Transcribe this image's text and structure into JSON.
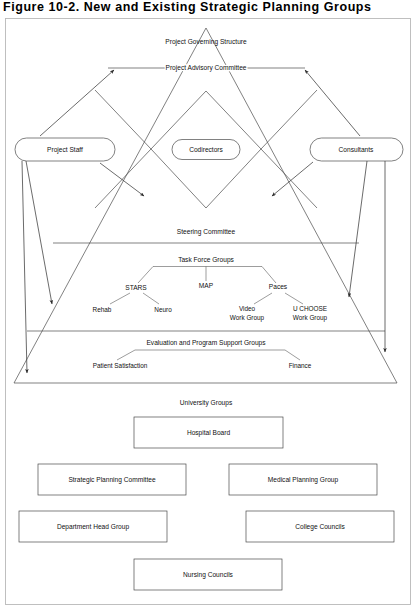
{
  "figure": {
    "title": "Figure 10-2.   New and Existing Strategic Planning Groups",
    "title_number": "Figure 10-2.",
    "title_text": "New and Existing Strategic Planning Groups"
  },
  "pyramid": {
    "levels": [
      {
        "id": "governing",
        "label": "Project Governing Structure"
      },
      {
        "id": "advisory",
        "label": "Project Advisory Committee"
      },
      {
        "id": "steering",
        "label": "Steering Committee"
      },
      {
        "id": "taskforce",
        "label": "Task Force Groups"
      },
      {
        "id": "evaluation",
        "label": "Evaluation and Program Support Groups"
      }
    ]
  },
  "pills": [
    {
      "id": "project-staff",
      "label": "Project Staff"
    },
    {
      "id": "codirectors",
      "label": "Codirectors"
    },
    {
      "id": "consultants",
      "label": "Consultants"
    }
  ],
  "task_force_tree": {
    "root": "Task Force Groups",
    "branches": [
      {
        "label": "STARS",
        "children": [
          "Rehab",
          "Neuro"
        ]
      },
      {
        "label": "MAP",
        "children": []
      },
      {
        "label": "Paces",
        "children": [
          "Video Work Group",
          "U CHOOSE Work Group"
        ]
      }
    ],
    "leaves": [
      {
        "label": "Rehab"
      },
      {
        "label": "Neuro"
      },
      {
        "label": "Video",
        "label2": "Work Group"
      },
      {
        "label": "U CHOOSE",
        "label2": "Work Group"
      }
    ]
  },
  "evaluation_tree": {
    "root": "Evaluation and Program Support Groups",
    "children": [
      "Patient Satisfaction",
      "Finance"
    ]
  },
  "university_groups": {
    "heading": "University Groups",
    "boxes": [
      {
        "id": "hospital-board",
        "label": "Hospital Board"
      },
      {
        "id": "strategic-planning-committee",
        "label": "Strategic Planning Committee"
      },
      {
        "id": "medical-planning-group",
        "label": "Medical Planning Group"
      },
      {
        "id": "department-head-group",
        "label": "Department Head Group"
      },
      {
        "id": "college-councils",
        "label": "College Councils"
      },
      {
        "id": "nursing-councils",
        "label": "Nursing Councils"
      }
    ]
  },
  "colors": {
    "line": "#4a4a4a",
    "text": "#111111",
    "frame": "#b9b9b9",
    "background": "#ffffff"
  }
}
